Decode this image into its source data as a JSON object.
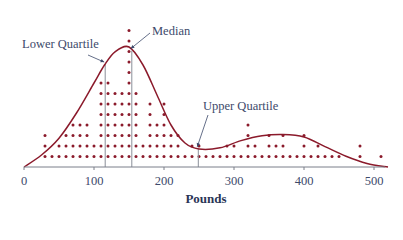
{
  "chart_data": {
    "type": "scatter",
    "subtype": "dot-plot-with-density-curve",
    "title": "",
    "xlabel": "Pounds",
    "ylabel": "",
    "xlim": [
      0,
      520
    ],
    "xticks": [
      0,
      100,
      200,
      300,
      400,
      500
    ],
    "xtick_labels": [
      "0",
      "100",
      "200",
      "300",
      "400",
      "500"
    ],
    "grid": false,
    "legend": null,
    "bin_width": 10,
    "dot_counts": {
      "x": [
        30,
        40,
        50,
        60,
        70,
        80,
        90,
        100,
        110,
        120,
        130,
        140,
        150,
        160,
        170,
        180,
        190,
        200,
        210,
        220,
        230,
        240,
        250,
        260,
        270,
        280,
        290,
        300,
        310,
        320,
        330,
        340,
        350,
        360,
        370,
        380,
        390,
        400,
        410,
        420,
        430,
        440,
        450,
        480,
        510
      ],
      "count": [
        3,
        1,
        2,
        3,
        4,
        4,
        4,
        2,
        8,
        8,
        7,
        7,
        13,
        7,
        2,
        6,
        4,
        6,
        3,
        3,
        1,
        2,
        2,
        1,
        1,
        1,
        2,
        2,
        1,
        4,
        2,
        1,
        3,
        2,
        3,
        1,
        1,
        3,
        1,
        2,
        1,
        1,
        1,
        2,
        1
      ]
    },
    "density_curve": {
      "x": [
        0,
        25,
        50,
        75,
        100,
        115,
        130,
        150,
        170,
        190,
        210,
        230,
        250,
        280,
        310,
        340,
        370,
        400,
        430,
        460,
        490,
        520
      ],
      "relative_height": [
        0.0,
        0.1,
        0.24,
        0.45,
        0.7,
        0.85,
        0.96,
        1.0,
        0.85,
        0.6,
        0.35,
        0.2,
        0.15,
        0.16,
        0.22,
        0.26,
        0.27,
        0.25,
        0.17,
        0.09,
        0.03,
        0.0
      ]
    },
    "annotations": [
      {
        "text": "Lower Quartile",
        "x": 116,
        "type": "vertical-line"
      },
      {
        "text": "Median",
        "x": 154,
        "type": "vertical-line"
      },
      {
        "text": "Upper Quartile",
        "x": 249,
        "type": "vertical-line"
      }
    ],
    "colors": {
      "dots": "#8b1a2b",
      "curve": "#8b1a2b",
      "quartile_lines": "#8a8f99",
      "text": "#3d4a6b"
    }
  }
}
